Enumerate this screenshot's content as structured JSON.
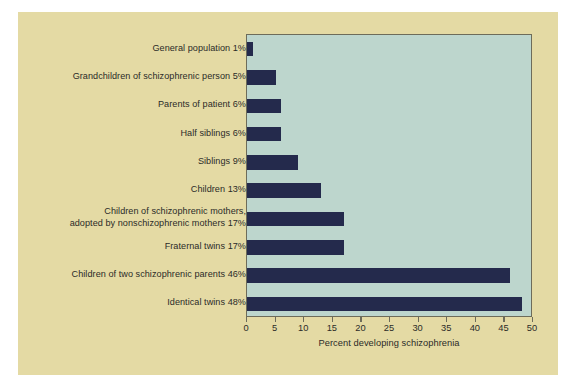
{
  "chart_data": {
    "type": "bar",
    "orientation": "horizontal",
    "title": "",
    "subtitle": "",
    "xlabel": "Percent developing schizophrenia",
    "ylabel": "",
    "xlim": [
      0,
      50
    ],
    "xticks": [
      0,
      5,
      10,
      15,
      20,
      25,
      30,
      35,
      40,
      45,
      50
    ],
    "xtick_labels": [
      "0",
      "5",
      "10",
      "15",
      "20",
      "25",
      "30",
      "35",
      "40",
      "45",
      "50"
    ],
    "grid": false,
    "legend": null,
    "categories": [
      "General population",
      "Grandchildren of schizophrenic person",
      "Parents of patient",
      "Half siblings",
      "Siblings",
      "Children",
      "Children of schizophrenic mothers, adopted by nonschizophrenic mothers",
      "Fraternal twins",
      "Children of two schizophrenic parents",
      "Identical twins"
    ],
    "values": [
      1,
      5,
      6,
      6,
      9,
      13,
      17,
      17,
      46,
      48
    ],
    "value_labels": [
      "1%",
      "5%",
      "6%",
      "6%",
      "9%",
      "13%",
      "17%",
      "17%",
      "46%",
      "48%"
    ],
    "row_labels": [
      "General population 1%",
      "Grandchildren of schizophrenic person 5%",
      "Parents of patient 6%",
      "Half siblings 6%",
      "Siblings 9%",
      "Children 13%",
      "Children of schizophrenic mothers,\nadopted by nonschizophrenic mothers 17%",
      "Fraternal twins 17%",
      "Children of two schizophrenic parents 46%",
      "Identical twins 48%"
    ],
    "colors": {
      "bar": "#242a4c",
      "plot_background": "#bdd6cd",
      "card_background": "#e4daa4",
      "page_background": "#ffffff",
      "axis": "#6d6c5a",
      "text": "#2b2b28"
    }
  }
}
